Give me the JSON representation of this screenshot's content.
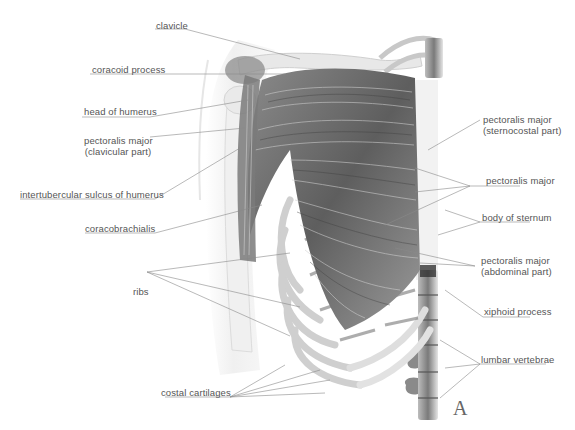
{
  "figure": {
    "panel_letter": "A",
    "colors": {
      "background": "#ffffff",
      "label_text": "#555555",
      "leader_line": "#8a8a8a",
      "muscle": "#6e6e6e",
      "bone": "#d9d9d9"
    }
  },
  "labels_left": [
    {
      "id": "clavicle",
      "text": "clavicle"
    },
    {
      "id": "coracoid-process",
      "text": "coracoid process"
    },
    {
      "id": "head-of-humerus",
      "text": "head of humerus"
    },
    {
      "id": "pectoralis-major-clavicular",
      "line1": "pectoralis major",
      "line2": "(clavicular part)"
    },
    {
      "id": "intertubercular-sulcus",
      "text": "intertubercular sulcus of humerus"
    },
    {
      "id": "coracobrachialis",
      "text": "coracobrachialis"
    },
    {
      "id": "ribs",
      "text": "ribs"
    },
    {
      "id": "costal-cartilages",
      "text": "costal cartilages"
    }
  ],
  "labels_right": [
    {
      "id": "pectoralis-major-sternocostal",
      "line1": "pectoralis major",
      "line2": "(sternocostal part)"
    },
    {
      "id": "pectoralis-major",
      "text": "pectoralis major"
    },
    {
      "id": "body-of-sternum",
      "text": "body of sternum"
    },
    {
      "id": "pectoralis-major-abdominal",
      "line1": "pectoralis major",
      "line2": "(abdominal part)"
    },
    {
      "id": "xiphoid-process",
      "text": "xiphoid process"
    },
    {
      "id": "lumbar-vertebrae",
      "text": "lumbar vertebrae"
    }
  ]
}
